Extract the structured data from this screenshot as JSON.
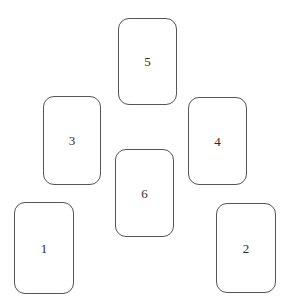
{
  "scene": {
    "name": "rounded-card-arrangement",
    "width": 288,
    "height": 307,
    "background_color": "#ffffff"
  },
  "style": {
    "card_fill": "#ffffff",
    "card_border_color": "#555555",
    "card_border_width_px": 1,
    "card_corner_radius_px": 11,
    "label_color": "#2b2b2b",
    "label_font_size_px": 13
  },
  "cards": [
    {
      "label": "1",
      "x": 14,
      "y": 202,
      "width": 60,
      "height": 92
    },
    {
      "label": "2",
      "x": 216,
      "y": 203,
      "width": 60,
      "height": 90
    },
    {
      "label": "3",
      "x": 43,
      "y": 96,
      "width": 58,
      "height": 89
    },
    {
      "label": "4",
      "x": 188,
      "y": 97,
      "width": 59,
      "height": 88
    },
    {
      "label": "5",
      "x": 118,
      "y": 18,
      "width": 59,
      "height": 87
    },
    {
      "label": "6",
      "x": 115,
      "y": 149,
      "width": 59,
      "height": 88
    }
  ]
}
